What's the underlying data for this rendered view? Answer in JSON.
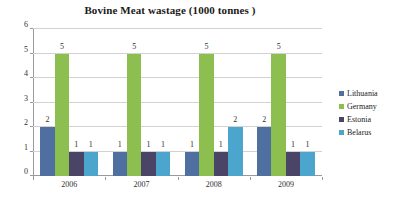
{
  "chart_data": {
    "type": "bar",
    "title": "Bovine Meat wastage (1000 tonnes )",
    "xlabel": "",
    "ylabel": "",
    "categories": [
      "2006",
      "2007",
      "2008",
      "2009"
    ],
    "series": [
      {
        "name": "Lithuania",
        "color": "#4f6fa0",
        "values": [
          2,
          1,
          1,
          2
        ]
      },
      {
        "name": "Germany",
        "color": "#8cbf4f",
        "values": [
          5,
          5,
          5,
          5
        ]
      },
      {
        "name": "Estonia",
        "color": "#4a4566",
        "values": [
          1,
          1,
          1,
          1
        ]
      },
      {
        "name": "Belarus",
        "color": "#4ca5cc",
        "values": [
          1,
          1,
          2,
          1
        ]
      }
    ],
    "ylim": [
      0,
      6
    ],
    "yticks": [
      0,
      1,
      2,
      3,
      4,
      5,
      6
    ],
    "ytick_labels": [
      "0",
      "1",
      "2",
      "3",
      "4",
      "5",
      "6"
    ],
    "grid": true,
    "data_labels": true,
    "legend_position": "right",
    "axis_color": "#9a9a9a",
    "gridline_color": "#d2d2d2",
    "background": "#ffffff"
  }
}
